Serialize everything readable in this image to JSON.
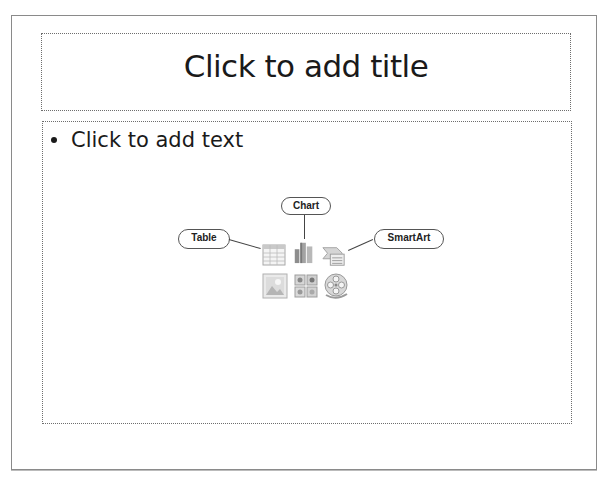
{
  "slide": {
    "title_placeholder": "Click to add title",
    "body_placeholder": "Click to add text",
    "content_icons": {
      "callouts": {
        "table": "Table",
        "chart": "Chart",
        "smartart": "SmartArt"
      },
      "icons": [
        {
          "name": "insert-table",
          "row": 1
        },
        {
          "name": "insert-chart",
          "row": 1
        },
        {
          "name": "insert-smartart",
          "row": 1
        },
        {
          "name": "insert-picture",
          "row": 2
        },
        {
          "name": "insert-clip-art",
          "row": 2
        },
        {
          "name": "insert-media",
          "row": 2
        }
      ]
    }
  }
}
